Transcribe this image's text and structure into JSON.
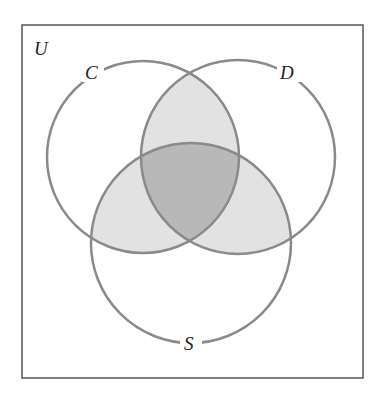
{
  "diagram": {
    "type": "venn",
    "universe_label": "U",
    "sets": [
      {
        "label": "C",
        "cx": 143,
        "cy": 157,
        "r": 96
      },
      {
        "label": "D",
        "cx": 238,
        "cy": 157,
        "r": 97
      },
      {
        "label": "S",
        "cx": 191,
        "cy": 243,
        "r": 100
      }
    ],
    "shaded_regions": [
      "C∩D",
      "C∩S",
      "D∩S",
      "C∩D∩S (darker)"
    ],
    "colors": {
      "stroke": "#8a8a8a",
      "border": "#555555",
      "light_shade": "#e2e2e2",
      "dark_shade": "#b8b8b8",
      "background": "#ffffff"
    }
  }
}
